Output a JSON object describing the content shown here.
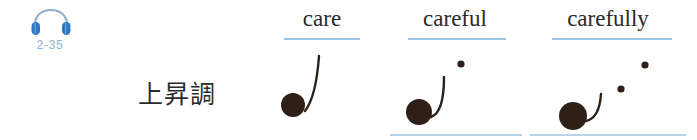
{
  "audio": {
    "icon": "headphone-icon",
    "track_label": "2-35"
  },
  "caption": {
    "tone_label": "上昇調"
  },
  "colors": {
    "accent_blue": "#9dc3e6",
    "label_blue": "#8fb4d9",
    "icon_blue": "#2f79c4",
    "icon_band": "#8fb0cc",
    "ink": "#2a2a2a",
    "dot": "#2e2017",
    "baseline": "#b8d4ec"
  },
  "columns": [
    {
      "word": "care",
      "left": 258,
      "width": 128,
      "underline": {
        "left": 26,
        "width": 76
      },
      "baseline": {
        "show": false,
        "left": 0,
        "width": 0
      },
      "big_dot": {
        "cx": 35,
        "cy": 61,
        "r": 12
      },
      "curve": "M 47 67 C 54 58, 59 40, 61 12",
      "small_dots": []
    },
    {
      "word": "careful",
      "left": 386,
      "width": 138,
      "underline": {
        "left": 22,
        "width": 98
      },
      "baseline": {
        "show": true,
        "left": 4,
        "width": 132
      },
      "big_dot": {
        "cx": 33,
        "cy": 68,
        "r": 13
      },
      "curve": "M 45 73 C 54 70, 58 57, 58 33",
      "small_dots": [
        {
          "cx": 75,
          "cy": 20,
          "r": 3.6
        }
      ]
    },
    {
      "word": "carefully",
      "left": 524,
      "width": 168,
      "underline": {
        "left": 28,
        "width": 120
      },
      "baseline": {
        "show": true,
        "left": 6,
        "width": 156
      },
      "big_dot": {
        "cx": 49,
        "cy": 72,
        "r": 14
      },
      "curve": "M 62 77 C 71 75, 76 66, 77 50",
      "small_dots": [
        {
          "cx": 97,
          "cy": 45,
          "r": 3.6
        },
        {
          "cx": 121,
          "cy": 21,
          "r": 3.6
        }
      ]
    }
  ]
}
